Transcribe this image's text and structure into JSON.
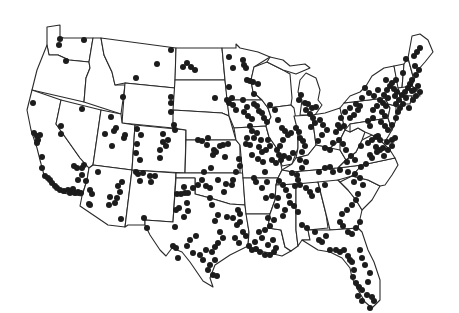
{
  "map": {
    "title": "",
    "region": "Contiguous United States",
    "style": "state outlines with point markers",
    "colors": {
      "background": "#ffffff",
      "outline": "#2a2a2a",
      "marker": "#1c1c1c"
    },
    "marker_radius": 3.0,
    "points": [
      [
        60,
        39
      ],
      [
        59,
        45
      ],
      [
        84,
        40
      ],
      [
        66,
        61
      ],
      [
        171,
        50
      ],
      [
        157,
        64
      ],
      [
        136,
        78
      ],
      [
        187,
        63
      ],
      [
        191,
        67
      ],
      [
        195,
        70
      ],
      [
        183,
        67
      ],
      [
        171,
        97
      ],
      [
        171,
        103
      ],
      [
        171,
        112
      ],
      [
        174,
        125
      ],
      [
        123,
        97
      ],
      [
        229,
        57
      ],
      [
        233,
        68
      ],
      [
        229,
        87
      ],
      [
        215,
        98
      ],
      [
        227,
        100
      ],
      [
        229,
        103
      ],
      [
        233,
        105
      ],
      [
        33,
        103
      ],
      [
        34,
        133
      ],
      [
        37,
        136
      ],
      [
        40,
        135
      ],
      [
        38,
        140
      ],
      [
        37,
        143
      ],
      [
        61,
        126
      ],
      [
        61,
        134
      ],
      [
        82,
        109
      ],
      [
        111,
        117
      ],
      [
        116,
        128
      ],
      [
        114,
        131
      ],
      [
        105,
        134
      ],
      [
        112,
        146
      ],
      [
        125,
        135
      ],
      [
        124,
        138
      ],
      [
        137,
        129
      ],
      [
        141,
        135
      ],
      [
        137,
        144
      ],
      [
        136,
        153
      ],
      [
        140,
        160
      ],
      [
        163,
        134
      ],
      [
        168,
        140
      ],
      [
        166,
        146
      ],
      [
        175,
        130
      ],
      [
        163,
        142
      ],
      [
        160,
        150
      ],
      [
        160,
        158
      ],
      [
        42,
        157
      ],
      [
        42,
        168
      ],
      [
        45,
        176
      ],
      [
        48,
        178
      ],
      [
        50,
        180
      ],
      [
        52,
        183
      ],
      [
        55,
        186
      ],
      [
        57,
        188
      ],
      [
        60,
        190
      ],
      [
        64,
        191
      ],
      [
        68,
        190
      ],
      [
        70,
        193
      ],
      [
        73,
        189
      ],
      [
        75,
        193
      ],
      [
        78,
        192
      ],
      [
        81,
        193
      ],
      [
        77,
        168
      ],
      [
        74,
        166
      ],
      [
        82,
        168
      ],
      [
        84,
        165
      ],
      [
        82,
        175
      ],
      [
        86,
        181
      ],
      [
        78,
        180
      ],
      [
        98,
        172
      ],
      [
        90,
        190
      ],
      [
        92,
        194
      ],
      [
        89,
        204
      ],
      [
        90,
        205
      ],
      [
        118,
        186
      ],
      [
        120,
        192
      ],
      [
        117,
        198
      ],
      [
        115,
        203
      ],
      [
        110,
        197
      ],
      [
        109,
        205
      ],
      [
        122,
        182
      ],
      [
        121,
        219
      ],
      [
        136,
        172
      ],
      [
        138,
        174
      ],
      [
        143,
        173
      ],
      [
        140,
        181
      ],
      [
        150,
        176
      ],
      [
        155,
        176
      ],
      [
        151,
        182
      ],
      [
        144,
        218
      ],
      [
        147,
        228
      ],
      [
        177,
        194
      ],
      [
        181,
        194
      ],
      [
        179,
        208
      ],
      [
        176,
        210
      ],
      [
        184,
        217
      ],
      [
        175,
        227
      ],
      [
        184,
        187
      ],
      [
        185,
        193
      ],
      [
        188,
        193
      ],
      [
        193,
        188
      ],
      [
        187,
        203
      ],
      [
        188,
        211
      ],
      [
        214,
        150
      ],
      [
        223,
        145
      ],
      [
        213,
        155
      ],
      [
        216,
        152
      ],
      [
        232,
        98
      ],
      [
        243,
        100
      ],
      [
        247,
        107
      ],
      [
        236,
        110
      ],
      [
        244,
        112
      ],
      [
        248,
        116
      ],
      [
        252,
        119
      ],
      [
        250,
        126
      ],
      [
        247,
        138
      ],
      [
        246,
        144
      ],
      [
        250,
        145
      ],
      [
        252,
        155
      ],
      [
        258,
        159
      ],
      [
        262,
        152
      ],
      [
        266,
        150
      ],
      [
        263,
        162
      ],
      [
        265,
        172
      ],
      [
        267,
        182
      ],
      [
        239,
        159
      ],
      [
        240,
        166
      ],
      [
        236,
        172
      ],
      [
        233,
        180
      ],
      [
        226,
        184
      ],
      [
        232,
        185
      ],
      [
        198,
        140
      ],
      [
        202,
        141
      ],
      [
        208,
        138
      ],
      [
        207,
        145
      ],
      [
        220,
        146
      ],
      [
        228,
        144
      ],
      [
        225,
        157
      ],
      [
        211,
        168
      ],
      [
        204,
        172
      ],
      [
        202,
        180
      ],
      [
        198,
        185
      ],
      [
        206,
        186
      ],
      [
        210,
        188
      ],
      [
        218,
        180
      ],
      [
        224,
        192
      ],
      [
        210,
        198
      ],
      [
        212,
        205
      ],
      [
        218,
        215
      ],
      [
        215,
        221
      ],
      [
        227,
        217
      ],
      [
        233,
        218
      ],
      [
        238,
        210
      ],
      [
        240,
        214
      ],
      [
        243,
        60
      ],
      [
        244,
        65
      ],
      [
        246,
        68
      ],
      [
        247,
        80
      ],
      [
        250,
        81
      ],
      [
        253,
        82
      ],
      [
        258,
        84
      ],
      [
        254,
        94
      ],
      [
        254,
        104
      ],
      [
        257,
        106
      ],
      [
        259,
        111
      ],
      [
        262,
        113
      ],
      [
        264,
        118
      ],
      [
        267,
        122
      ],
      [
        270,
        105
      ],
      [
        275,
        110
      ],
      [
        278,
        120
      ],
      [
        282,
        128
      ],
      [
        285,
        131
      ],
      [
        288,
        135
      ],
      [
        291,
        133
      ],
      [
        283,
        140
      ],
      [
        280,
        146
      ],
      [
        277,
        150
      ],
      [
        279,
        155
      ],
      [
        270,
        146
      ],
      [
        268,
        140
      ],
      [
        272,
        160
      ],
      [
        276,
        163
      ],
      [
        281,
        160
      ],
      [
        284,
        156
      ],
      [
        289,
        158
      ],
      [
        293,
        153
      ],
      [
        257,
        133
      ],
      [
        254,
        138
      ],
      [
        252,
        131
      ],
      [
        261,
        140
      ],
      [
        259,
        147
      ],
      [
        296,
        128
      ],
      [
        299,
        132
      ],
      [
        300,
        138
      ],
      [
        303,
        141
      ],
      [
        305,
        146
      ],
      [
        302,
        152
      ],
      [
        300,
        160
      ],
      [
        306,
        162
      ],
      [
        302,
        168
      ],
      [
        310,
        114
      ],
      [
        306,
        110
      ],
      [
        313,
        118
      ],
      [
        315,
        123
      ],
      [
        311,
        127
      ],
      [
        299,
        100
      ],
      [
        301,
        95
      ],
      [
        305,
        103
      ],
      [
        308,
        104
      ],
      [
        312,
        108
      ],
      [
        316,
        107
      ],
      [
        320,
        120
      ],
      [
        323,
        125
      ],
      [
        327,
        130
      ],
      [
        322,
        135
      ],
      [
        318,
        141
      ],
      [
        325,
        148
      ],
      [
        330,
        150
      ],
      [
        333,
        143
      ],
      [
        336,
        132
      ],
      [
        340,
        128
      ],
      [
        344,
        126
      ],
      [
        350,
        118
      ],
      [
        354,
        115
      ],
      [
        358,
        110
      ],
      [
        360,
        106
      ],
      [
        356,
        104
      ],
      [
        350,
        108
      ],
      [
        345,
        112
      ],
      [
        341,
        118
      ],
      [
        338,
        125
      ],
      [
        339,
        140
      ],
      [
        343,
        144
      ],
      [
        346,
        150
      ],
      [
        351,
        156
      ],
      [
        347,
        162
      ],
      [
        355,
        160
      ],
      [
        361,
        146
      ],
      [
        368,
        143
      ],
      [
        372,
        140
      ],
      [
        376,
        137
      ],
      [
        376,
        147
      ],
      [
        380,
        150
      ],
      [
        383,
        148
      ],
      [
        370,
        126
      ],
      [
        368,
        121
      ],
      [
        373,
        118
      ],
      [
        373,
        110
      ],
      [
        377,
        106
      ],
      [
        380,
        100
      ],
      [
        384,
        95
      ],
      [
        387,
        90
      ],
      [
        390,
        86
      ],
      [
        392,
        83
      ],
      [
        386,
        80
      ],
      [
        394,
        89
      ],
      [
        397,
        92
      ],
      [
        395,
        96
      ],
      [
        388,
        98
      ],
      [
        383,
        103
      ],
      [
        386,
        106
      ],
      [
        382,
        112
      ],
      [
        385,
        116
      ],
      [
        381,
        122
      ],
      [
        385,
        126
      ],
      [
        388,
        130
      ],
      [
        392,
        125
      ],
      [
        396,
        118
      ],
      [
        398,
        112
      ],
      [
        400,
        108
      ],
      [
        396,
        104
      ],
      [
        399,
        100
      ],
      [
        402,
        95
      ],
      [
        405,
        92
      ],
      [
        408,
        88
      ],
      [
        410,
        84
      ],
      [
        412,
        91
      ],
      [
        406,
        98
      ],
      [
        403,
        104
      ],
      [
        409,
        108
      ],
      [
        413,
        100
      ],
      [
        416,
        96
      ],
      [
        414,
        90
      ],
      [
        418,
        86
      ],
      [
        420,
        92
      ],
      [
        378,
        136
      ],
      [
        380,
        140
      ],
      [
        387,
        142
      ],
      [
        392,
        140
      ],
      [
        395,
        138
      ],
      [
        392,
        146
      ],
      [
        388,
        150
      ],
      [
        384,
        156
      ],
      [
        365,
        88
      ],
      [
        369,
        93
      ],
      [
        362,
        98
      ],
      [
        374,
        96
      ],
      [
        378,
        90
      ],
      [
        406,
        59
      ],
      [
        415,
        66
      ],
      [
        419,
        70
      ],
      [
        416,
        75
      ],
      [
        412,
        80
      ],
      [
        403,
        73
      ],
      [
        396,
        80
      ],
      [
        420,
        48
      ],
      [
        417,
        52
      ],
      [
        414,
        56
      ],
      [
        377,
        152
      ],
      [
        370,
        155
      ],
      [
        372,
        158
      ],
      [
        366,
        164
      ],
      [
        361,
        167
      ],
      [
        319,
        172
      ],
      [
        325,
        168
      ],
      [
        330,
        167
      ],
      [
        333,
        172
      ],
      [
        340,
        170
      ],
      [
        348,
        172
      ],
      [
        355,
        174
      ],
      [
        360,
        178
      ],
      [
        354,
        182
      ],
      [
        363,
        185
      ],
      [
        358,
        194
      ],
      [
        356,
        200
      ],
      [
        352,
        205
      ],
      [
        347,
        210
      ],
      [
        342,
        214
      ],
      [
        340,
        222
      ],
      [
        343,
        226
      ],
      [
        292,
        173
      ],
      [
        297,
        175
      ],
      [
        298,
        180
      ],
      [
        295,
        186
      ],
      [
        300,
        185
      ],
      [
        306,
        188
      ],
      [
        310,
        192
      ],
      [
        312,
        196
      ],
      [
        318,
        190
      ],
      [
        325,
        185
      ],
      [
        279,
        181
      ],
      [
        283,
        185
      ],
      [
        286,
        190
      ],
      [
        289,
        196
      ],
      [
        290,
        203
      ],
      [
        294,
        206
      ],
      [
        298,
        212
      ],
      [
        254,
        178
      ],
      [
        256,
        182
      ],
      [
        262,
        188
      ],
      [
        266,
        198
      ],
      [
        272,
        196
      ],
      [
        278,
        198
      ],
      [
        277,
        206
      ],
      [
        285,
        210
      ],
      [
        283,
        216
      ],
      [
        302,
        225
      ],
      [
        307,
        228
      ],
      [
        315,
        232
      ],
      [
        319,
        240
      ],
      [
        322,
        242
      ],
      [
        326,
        236
      ],
      [
        268,
        218
      ],
      [
        274,
        220
      ],
      [
        270,
        226
      ],
      [
        265,
        230
      ],
      [
        259,
        232
      ],
      [
        262,
        238
      ],
      [
        255,
        242
      ],
      [
        268,
        245
      ],
      [
        249,
        246
      ],
      [
        252,
        250
      ],
      [
        256,
        249
      ],
      [
        260,
        252
      ],
      [
        265,
        255
      ],
      [
        270,
        255
      ],
      [
        274,
        252
      ],
      [
        276,
        248
      ],
      [
        273,
        240
      ],
      [
        243,
        232
      ],
      [
        246,
        236
      ],
      [
        239,
        243
      ],
      [
        235,
        238
      ],
      [
        237,
        225
      ],
      [
        240,
        222
      ],
      [
        220,
        232
      ],
      [
        223,
        238
      ],
      [
        218,
        243
      ],
      [
        215,
        247
      ],
      [
        212,
        252
      ],
      [
        215,
        260
      ],
      [
        210,
        265
      ],
      [
        208,
        270
      ],
      [
        213,
        275
      ],
      [
        217,
        276
      ],
      [
        200,
        255
      ],
      [
        203,
        260
      ],
      [
        206,
        250
      ],
      [
        193,
        253
      ],
      [
        187,
        246
      ],
      [
        190,
        240
      ],
      [
        196,
        236
      ],
      [
        173,
        246
      ],
      [
        176,
        248
      ],
      [
        178,
        258
      ],
      [
        330,
        250
      ],
      [
        336,
        250
      ],
      [
        340,
        252
      ],
      [
        344,
        250
      ],
      [
        348,
        256
      ],
      [
        350,
        260
      ],
      [
        352,
        262
      ],
      [
        354,
        270
      ],
      [
        353,
        277
      ],
      [
        356,
        283
      ],
      [
        359,
        287
      ],
      [
        362,
        290
      ],
      [
        358,
        296
      ],
      [
        362,
        301
      ],
      [
        367,
        295
      ],
      [
        372,
        297
      ],
      [
        374,
        301
      ],
      [
        370,
        308
      ],
      [
        368,
        282
      ],
      [
        370,
        273
      ],
      [
        365,
        265
      ],
      [
        362,
        258
      ],
      [
        360,
        250
      ],
      [
        352,
        234
      ],
      [
        348,
        232
      ],
      [
        356,
        228
      ],
      [
        360,
        222
      ]
    ]
  }
}
